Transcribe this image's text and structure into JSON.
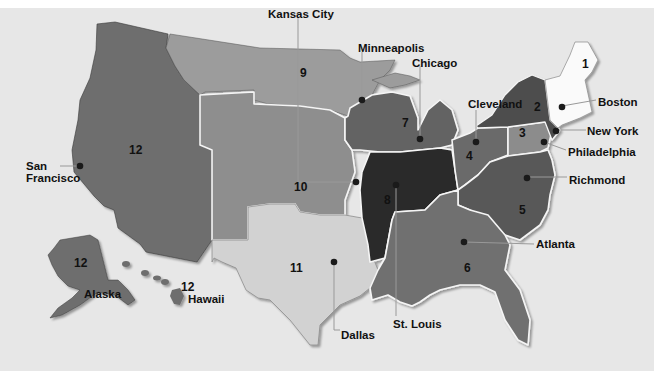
{
  "map": {
    "subject": "Federal Reserve Districts",
    "colors": {
      "background": "#e7e7e7",
      "d1": "#fafafa",
      "d2": "#4e4e4e",
      "d3": "#8c8c8c",
      "d4": "#6a6a6a",
      "d5": "#585858",
      "d6": "#707070",
      "d7": "#646464",
      "d8": "#2c2c2c",
      "d9": "#9c9c9c",
      "d10": "#8e8e8e",
      "d11": "#d2d2d2",
      "d12": "#6e6e6e"
    },
    "districts": [
      {
        "id": "1",
        "label": "1"
      },
      {
        "id": "2",
        "label": "2"
      },
      {
        "id": "3",
        "label": "3"
      },
      {
        "id": "4",
        "label": "4"
      },
      {
        "id": "5",
        "label": "5"
      },
      {
        "id": "6",
        "label": "6"
      },
      {
        "id": "7",
        "label": "7"
      },
      {
        "id": "8",
        "label": "8"
      },
      {
        "id": "9",
        "label": "9"
      },
      {
        "id": "10",
        "label": "10"
      },
      {
        "id": "11",
        "label": "11"
      },
      {
        "id": "12",
        "label": "12"
      },
      {
        "id": "12-alaska",
        "label": "12"
      },
      {
        "id": "12-hawaii",
        "label": "12"
      }
    ],
    "cities": [
      {
        "name": "Boston"
      },
      {
        "name": "New York"
      },
      {
        "name": "Philadelphia"
      },
      {
        "name": "Cleveland"
      },
      {
        "name": "Richmond"
      },
      {
        "name": "Atlanta"
      },
      {
        "name": "Chicago"
      },
      {
        "name": "St. Louis"
      },
      {
        "name": "Minneapolis"
      },
      {
        "name": "Kansas City"
      },
      {
        "name": "Dallas"
      },
      {
        "name": "San Francisco"
      }
    ],
    "region_labels": {
      "alaska": "Alaska",
      "hawaii": "Hawaii"
    }
  }
}
